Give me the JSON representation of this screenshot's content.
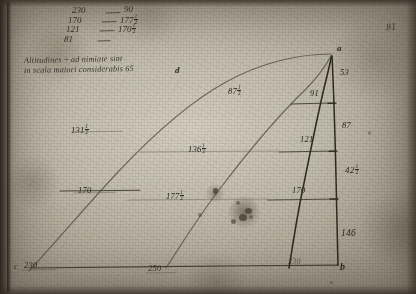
{
  "document": {
    "kind": "handwritten-manuscript-page",
    "medium": "ink on aged paper",
    "folio_mark": "81"
  },
  "table": {
    "rows": [
      {
        "left": "230",
        "dash": "—",
        "right": "90"
      },
      {
        "left": "170",
        "dash": "—",
        "right": "177",
        "right_frac": "1/2"
      },
      {
        "left": "121",
        "dash": "—",
        "right": "170",
        "right_frac": "1/2"
      },
      {
        "left": "81",
        "dash": "—",
        "right": ""
      }
    ]
  },
  "note": {
    "line1": "Altitudines ÷ ad nimiate sint",
    "line2": "in scala maiori considerabis 65"
  },
  "diagram": {
    "points": {
      "apex": "a",
      "bottom_right": "b",
      "bottom_left": "c",
      "upper_curve": "d"
    },
    "labels": {
      "c_value": "230",
      "axis_bottom_left": "250",
      "axis_bottom_right": "230",
      "left_curve_upper": "131",
      "left_curve_upper_frac": "1/2",
      "left_curve_lower": "170",
      "mid_curve_upper": "87",
      "mid_curve_upper_frac": "1/2",
      "mid_curve_mid": "136",
      "mid_curve_mid_frac": "1/2",
      "mid_curve_lower": "177",
      "mid_curve_lower_frac": "1/2",
      "right_curve_top": "91",
      "right_curve_mid": "121",
      "right_curve_low": "170",
      "vertical_top": "53",
      "vertical_mid": "87",
      "vertical_low": "42",
      "vertical_low_frac": "1/2",
      "vertical_bottom": "146"
    }
  },
  "colors": {
    "ink": "#2e2a22",
    "ink_soft": "#4a4438",
    "paper": "#c6c0b1",
    "edge": "#1c1812"
  }
}
